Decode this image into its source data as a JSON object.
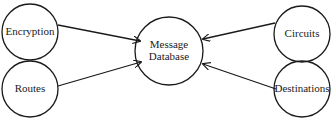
{
  "diagram": {
    "type": "data-flow",
    "colors": {
      "stroke": "#1a1a1a",
      "background": "#ffffff",
      "text": "#1a1a1a"
    },
    "nodes": [
      {
        "id": "encryption",
        "label": "Encryption",
        "cx": 30,
        "cy": 32,
        "r": 28,
        "font_size": 11
      },
      {
        "id": "routes",
        "label": "Routes",
        "cx": 30,
        "cy": 89,
        "r": 28,
        "font_size": 11
      },
      {
        "id": "message_database",
        "label": "Message Database",
        "line1": "Message",
        "line2": "Database",
        "cx": 169,
        "cy": 51,
        "r": 34,
        "font_size": 11
      },
      {
        "id": "circuits",
        "label": "Circuits",
        "cx": 302,
        "cy": 34,
        "r": 28,
        "font_size": 11
      },
      {
        "id": "destinations",
        "label": "Destinations",
        "cx": 302,
        "cy": 89,
        "r": 28,
        "font_size": 11
      }
    ],
    "edges": [
      {
        "from": "encryption",
        "to": "message_database",
        "x1": 58,
        "y1": 25,
        "x2": 140,
        "y2": 41
      },
      {
        "from": "routes",
        "to": "message_database",
        "x1": 58,
        "y1": 86,
        "x2": 141,
        "y2": 62
      },
      {
        "from": "circuits",
        "to": "message_database",
        "x1": 275,
        "y1": 23,
        "x2": 203,
        "y2": 39
      },
      {
        "from": "destinations",
        "to": "message_database",
        "x1": 276,
        "y1": 89,
        "x2": 203,
        "y2": 64
      }
    ]
  }
}
